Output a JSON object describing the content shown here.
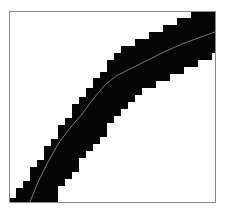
{
  "chart_data": {
    "type": "line",
    "title": "",
    "xlabel": "",
    "ylabel": "",
    "grid": false,
    "legend": "none",
    "frame": {
      "left": 9.5,
      "top": 11.5,
      "right": 215.5,
      "bottom": 202.5,
      "color": "#8a8a8a"
    },
    "band": {
      "description": "pixelated (7px-step) black band following the curve",
      "color": "#050505",
      "cell": 7,
      "upper_edge": [
        [
          9,
          202
        ],
        [
          9,
          198
        ],
        [
          16,
          198
        ],
        [
          16,
          188
        ],
        [
          23,
          188
        ],
        [
          23,
          181
        ],
        [
          30,
          181
        ],
        [
          30,
          167
        ],
        [
          37,
          167
        ],
        [
          37,
          160
        ],
        [
          44,
          160
        ],
        [
          44,
          146
        ],
        [
          51,
          146
        ],
        [
          51,
          139
        ],
        [
          58,
          139
        ],
        [
          58,
          125
        ],
        [
          65,
          125
        ],
        [
          65,
          118
        ],
        [
          72,
          118
        ],
        [
          72,
          104
        ],
        [
          79,
          104
        ],
        [
          79,
          97
        ],
        [
          86,
          97
        ],
        [
          86,
          88
        ],
        [
          93,
          88
        ],
        [
          93,
          78
        ],
        [
          100,
          78
        ],
        [
          100,
          72
        ],
        [
          107,
          72
        ],
        [
          107,
          60
        ],
        [
          114,
          60
        ],
        [
          114,
          53
        ],
        [
          121,
          53
        ],
        [
          121,
          46
        ],
        [
          135,
          46
        ],
        [
          135,
          39
        ],
        [
          149,
          39
        ],
        [
          149,
          32
        ],
        [
          163,
          32
        ],
        [
          163,
          25
        ],
        [
          177,
          25
        ],
        [
          177,
          18
        ],
        [
          191,
          18
        ],
        [
          191,
          11
        ],
        [
          215,
          11
        ]
      ],
      "lower_edge": [
        [
          215,
          53
        ],
        [
          212,
          53
        ],
        [
          212,
          60
        ],
        [
          198,
          60
        ],
        [
          198,
          67
        ],
        [
          184,
          67
        ],
        [
          184,
          74
        ],
        [
          170,
          74
        ],
        [
          170,
          81
        ],
        [
          156,
          81
        ],
        [
          156,
          88
        ],
        [
          142,
          88
        ],
        [
          142,
          95
        ],
        [
          135,
          95
        ],
        [
          135,
          102
        ],
        [
          128,
          102
        ],
        [
          128,
          109
        ],
        [
          121,
          109
        ],
        [
          121,
          116
        ],
        [
          114,
          116
        ],
        [
          114,
          123
        ],
        [
          107,
          123
        ],
        [
          107,
          137
        ],
        [
          100,
          137
        ],
        [
          100,
          144
        ],
        [
          93,
          144
        ],
        [
          93,
          151
        ],
        [
          86,
          151
        ],
        [
          86,
          158
        ],
        [
          79,
          158
        ],
        [
          79,
          172
        ],
        [
          72,
          172
        ],
        [
          72,
          179
        ],
        [
          65,
          179
        ],
        [
          65,
          186
        ],
        [
          58,
          186
        ],
        [
          58,
          202
        ]
      ]
    },
    "series": [
      {
        "name": "center-line",
        "color": "#7a7a7a",
        "points": [
          [
            30,
            202
          ],
          [
            38,
            182
          ],
          [
            48,
            162
          ],
          [
            58,
            144
          ],
          [
            70,
            128
          ],
          [
            82,
            114
          ],
          [
            94,
            98
          ],
          [
            104,
            86
          ],
          [
            116,
            76
          ],
          [
            132,
            68
          ],
          [
            148,
            60
          ],
          [
            164,
            52
          ],
          [
            182,
            44
          ],
          [
            198,
            38
          ],
          [
            215,
            32
          ]
        ]
      }
    ]
  }
}
